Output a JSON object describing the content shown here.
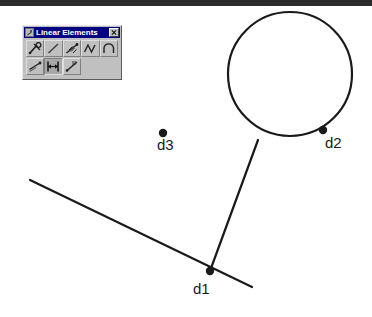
{
  "window": {
    "top_bar_color": "#2b2b2b",
    "canvas_background": "#ffffff"
  },
  "palette": {
    "title": "Linear Elements",
    "icon_name": "linear-elements-icon",
    "close_label": "✕",
    "titlebar_color": "#000080",
    "face_color": "#c0c0c0",
    "rows": [
      [
        {
          "name": "polyline-node-tool",
          "pressed": false,
          "label": "Polyline with node"
        },
        {
          "name": "line-segment-tool",
          "pressed": false,
          "label": "Line segment"
        },
        {
          "name": "arrow-chain-tool",
          "pressed": false,
          "label": "Arrow chain"
        },
        {
          "name": "zigzag-tool",
          "pressed": false,
          "label": "Zigzag polyline"
        },
        {
          "name": "arc-tool",
          "pressed": false,
          "label": "Arc"
        }
      ],
      [
        {
          "name": "offset-line-tool",
          "pressed": false,
          "label": "Offset line"
        },
        {
          "name": "dimension-tool",
          "pressed": true,
          "label": "Dimension"
        },
        {
          "name": "annotate-line-tool",
          "pressed": false,
          "label": "Annotated line"
        },
        {
          "name": "spacer-1",
          "pressed": false,
          "label": ""
        },
        {
          "name": "spacer-2",
          "pressed": false,
          "label": ""
        }
      ]
    ]
  },
  "drawing": {
    "stroke_color": "#1a1a1a",
    "circle": {
      "name": "circle-shape",
      "cx": 290,
      "cy": 74,
      "r": 62
    },
    "lines": [
      {
        "name": "diagonal-line",
        "x1": 30,
        "y1": 180,
        "x2": 252,
        "y2": 287
      },
      {
        "name": "connector-line",
        "x1": 210,
        "y1": 271,
        "x2": 258,
        "y2": 140
      }
    ],
    "points": [
      {
        "name": "point-d1",
        "label": "d1",
        "x": 210,
        "y": 271,
        "label_x": 193,
        "label_y": 280
      },
      {
        "name": "point-d2",
        "label": "d2",
        "x": 323,
        "y": 130,
        "label_x": 325,
        "label_y": 134
      },
      {
        "name": "point-d3",
        "label": "d3",
        "x": 163,
        "y": 133,
        "label_x": 157,
        "label_y": 136
      }
    ]
  }
}
